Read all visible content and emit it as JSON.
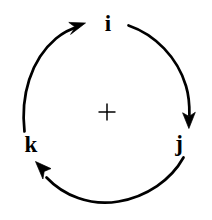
{
  "diagram": {
    "type": "cyclic-permutation-diagram",
    "orientation": "clockwise",
    "background_color": "#ffffff",
    "stroke_color": "#000000",
    "center_marker": {
      "glyph": "plus",
      "x": 107,
      "y": 112,
      "size": 17
    },
    "circle": {
      "center_x": 107,
      "center_y": 112,
      "radius": 85,
      "stroke_width": 2.6
    },
    "labels": [
      {
        "id": "i",
        "text": "i",
        "position": "top",
        "x": 107,
        "y": 24
      },
      {
        "id": "j",
        "text": "j",
        "position": "right",
        "x": 179,
        "y": 144
      },
      {
        "id": "k",
        "text": "k",
        "position": "bottom-left",
        "x": 31,
        "y": 145
      }
    ],
    "arrows": [
      {
        "id": "k-to-i",
        "from": "k",
        "to": "i",
        "side": "left",
        "head_direction": "up-right",
        "head_x": 80,
        "head_y": 27
      },
      {
        "id": "i-to-j",
        "from": "i",
        "to": "j",
        "side": "right",
        "head_direction": "down",
        "head_x": 189,
        "head_y": 125
      },
      {
        "id": "j-to-k",
        "from": "j",
        "to": "k",
        "side": "bottom",
        "head_direction": "up-left",
        "head_x": 37,
        "head_y": 162
      }
    ]
  }
}
